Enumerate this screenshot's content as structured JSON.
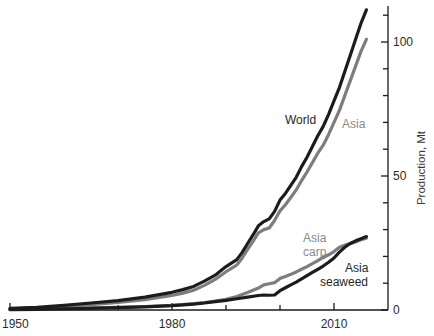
{
  "chart_data": {
    "type": "line",
    "title": "",
    "xlabel": "",
    "ylabel": "Production, Mt",
    "xlim": [
      1950,
      2016
    ],
    "ylim": [
      0,
      120
    ],
    "grid": false,
    "legend_position": "inline-labels",
    "x_tick_labels": [
      "1950",
      "1980",
      "2010"
    ],
    "x_tick_values": [
      1950,
      1980,
      2010
    ],
    "x_minor_tick_values": [
      1960,
      1970,
      1990,
      2000
    ],
    "y_tick_labels": [
      "0",
      "50",
      "100"
    ],
    "y_tick_values": [
      0,
      50,
      100
    ],
    "y_minor_tick_values": [
      10,
      20,
      30,
      40,
      60,
      70,
      80,
      90,
      110
    ],
    "axis_position": {
      "y_axis": "right",
      "x_axis": "bottom"
    },
    "colors": {
      "dark": "#1c1c1c",
      "gray": "#7d7d7d"
    },
    "series": [
      {
        "name": "World",
        "label": "World",
        "color": "#1c1c1c",
        "label_color_key": "dark",
        "x": [
          1950,
          1955,
          1960,
          1965,
          1970,
          1975,
          1980,
          1982,
          1984,
          1986,
          1988,
          1990,
          1991,
          1992,
          1993,
          1994,
          1995,
          1996,
          1997,
          1998,
          1999,
          2000,
          2001,
          2002,
          2003,
          2004,
          2005,
          2006,
          2007,
          2008,
          2009,
          2010,
          2011,
          2012,
          2013,
          2014,
          2015,
          2016
        ],
        "values": [
          0.6,
          1.0,
          1.7,
          2.6,
          3.5,
          4.8,
          6.6,
          7.6,
          8.8,
          10.8,
          13.0,
          16.2,
          17.5,
          18.8,
          21.5,
          24.8,
          28.0,
          31.4,
          33.0,
          34.0,
          36.8,
          41.0,
          43.5,
          46.5,
          49.5,
          53.5,
          57.0,
          61.0,
          65.0,
          68.5,
          73.0,
          78.0,
          83.0,
          89.0,
          95.0,
          101.0,
          107.0,
          112.0
        ]
      },
      {
        "name": "Asia",
        "label": "Asia",
        "color": "#7d7d7d",
        "label_color_key": "gray",
        "x": [
          1950,
          1955,
          1960,
          1965,
          1970,
          1975,
          1980,
          1982,
          1984,
          1986,
          1988,
          1990,
          1991,
          1992,
          1993,
          1994,
          1995,
          1996,
          1997,
          1998,
          1999,
          2000,
          2001,
          2002,
          2003,
          2004,
          2005,
          2006,
          2007,
          2008,
          2009,
          2010,
          2011,
          2012,
          2013,
          2014,
          2015,
          2016
        ],
        "values": [
          0.4,
          0.8,
          1.3,
          2.0,
          2.8,
          3.9,
          5.4,
          6.3,
          7.4,
          9.2,
          11.4,
          14.3,
          15.5,
          16.8,
          19.4,
          22.6,
          25.6,
          28.8,
          30.0,
          30.6,
          33.4,
          37.0,
          39.3,
          42.0,
          44.8,
          48.3,
          51.5,
          55.0,
          58.5,
          61.5,
          65.5,
          70.0,
          74.5,
          80.0,
          85.5,
          91.0,
          96.5,
          101.0
        ]
      },
      {
        "name": "Asia carp",
        "label": "Asia\ncarp",
        "label_lines": [
          "Asia",
          "carp"
        ],
        "color": "#7d7d7d",
        "label_color_key": "gray",
        "x": [
          1950,
          1955,
          1960,
          1965,
          1970,
          1975,
          1980,
          1982,
          1984,
          1986,
          1988,
          1990,
          1992,
          1994,
          1996,
          1997,
          1998,
          1999,
          2000,
          2001,
          2002,
          2003,
          2004,
          2005,
          2006,
          2007,
          2008,
          2009,
          2010,
          2011,
          2012,
          2013,
          2014,
          2015,
          2016
        ],
        "values": [
          0.2,
          0.35,
          0.5,
          0.8,
          1.0,
          1.3,
          1.7,
          2.0,
          2.4,
          2.8,
          3.3,
          4.0,
          5.0,
          6.5,
          8.2,
          9.4,
          9.8,
          10.2,
          11.8,
          12.5,
          13.3,
          14.2,
          15.2,
          16.2,
          17.3,
          18.4,
          19.6,
          20.6,
          21.8,
          23.4,
          24.2,
          24.8,
          25.4,
          26.2,
          26.8
        ]
      },
      {
        "name": "Asia seaweed",
        "label": "Asia\nseaweed",
        "label_lines": [
          "Asia",
          "seaweed"
        ],
        "color": "#1c1c1c",
        "label_color_key": "dark",
        "x": [
          1950,
          1955,
          1960,
          1965,
          1970,
          1975,
          1980,
          1982,
          1984,
          1986,
          1988,
          1990,
          1992,
          1994,
          1996,
          1997,
          1998,
          1999,
          2000,
          2001,
          2002,
          2003,
          2004,
          2005,
          2006,
          2007,
          2008,
          2009,
          2010,
          2011,
          2012,
          2013,
          2014,
          2015,
          2016
        ],
        "values": [
          0.15,
          0.25,
          0.4,
          0.6,
          0.9,
          1.2,
          1.6,
          1.9,
          2.2,
          2.6,
          3.1,
          3.6,
          4.2,
          4.8,
          5.4,
          5.6,
          5.5,
          5.6,
          7.2,
          8.3,
          9.4,
          10.4,
          11.6,
          12.8,
          14.0,
          15.2,
          16.4,
          17.8,
          19.4,
          21.6,
          23.4,
          24.8,
          25.8,
          26.6,
          27.4
        ]
      }
    ],
    "inline_labels": [
      {
        "text": "World",
        "x_px": 285,
        "y_px": 124,
        "color_key": "dark"
      },
      {
        "text": "Asia",
        "x_px": 342,
        "y_px": 128,
        "color_key": "gray"
      },
      {
        "text": "Asia",
        "x_px": 303,
        "y_px": 242,
        "color_key": "gray"
      },
      {
        "text": "carp",
        "x_px": 303,
        "y_px": 256,
        "color_key": "gray"
      },
      {
        "text": "Asia",
        "x_px": 345,
        "y_px": 272,
        "color_key": "dark"
      },
      {
        "text": "seaweed",
        "x_px": 320,
        "y_px": 286,
        "color_key": "dark"
      }
    ]
  }
}
